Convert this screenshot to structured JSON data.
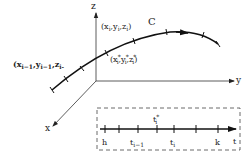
{
  "diagram": {
    "type": "space-curve-partition",
    "axes": {
      "x_label": "x",
      "y_label": "y",
      "z_label": "z"
    },
    "curve": {
      "label": "C",
      "color": "#1a1a1a"
    },
    "points": {
      "p_i": {
        "text": "(x",
        "parts": [
          "i",
          "y",
          "i",
          "z",
          "i"
        ]
      },
      "p_prev_label": "(x",
      "p_star_label": "(x"
    },
    "labels": {
      "pi_open": "(x",
      "pi_x_sub": "i",
      "pi_y": ",y",
      "pi_y_sub": "i",
      "pi_z": ",z",
      "pi_z_sub": "i",
      "pi_close": ")",
      "pstar_open": "(x",
      "pstar_x_sub": "i",
      "pstar_x_sup": "*",
      "pstar_y": ",y",
      "pstar_y_sub": "i",
      "pstar_y_sup": "*",
      "pstar_z": ",z",
      "pstar_z_sub": "i",
      "pstar_z_sup": "*",
      "pstar_close": ")",
      "pprev_open": "(x",
      "pprev_x_sub": "i−1",
      "pprev_y": ",y",
      "pprev_y_sub": "i−1",
      "pprev_z": ",z",
      "pprev_z_sub": "i-"
    },
    "parameter_interval": {
      "axis_label": "t",
      "tick_labels": {
        "h": "h",
        "t_prev": "t",
        "t_prev_sub": "i−1",
        "t_star": "t",
        "t_star_sub": "i",
        "t_star_sup": "*",
        "t_i": "t",
        "t_i_sub": "i",
        "k": "k"
      },
      "box_style": "dashed"
    },
    "colors": {
      "line": "#1a1a1a",
      "axis": "#333333",
      "background": "#ffffff"
    }
  }
}
